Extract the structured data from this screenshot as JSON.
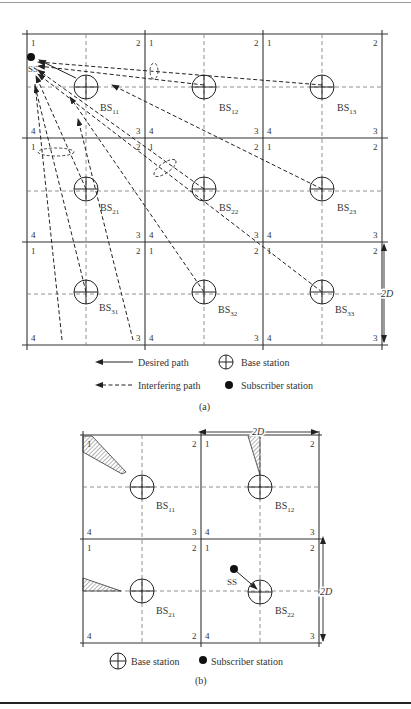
{
  "figure_a": {
    "caption": "(a)",
    "corner_labels": [
      "1",
      "2",
      "3",
      "4"
    ],
    "base_stations": [
      {
        "id": "BS11",
        "label": "BS",
        "sub": "11"
      },
      {
        "id": "BS12",
        "label": "BS",
        "sub": "12"
      },
      {
        "id": "BS13",
        "label": "BS",
        "sub": "13"
      },
      {
        "id": "BS21",
        "label": "BS",
        "sub": "21"
      },
      {
        "id": "BS22",
        "label": "BS",
        "sub": "22"
      },
      {
        "id": "BS23",
        "label": "BS",
        "sub": "23"
      },
      {
        "id": "BS31",
        "label": "BS",
        "sub": "31"
      },
      {
        "id": "BS32",
        "label": "BS",
        "sub": "32"
      },
      {
        "id": "BS33",
        "label": "BS",
        "sub": "33"
      }
    ],
    "subscriber_label": "SS",
    "dimension_label": "2D",
    "legend": {
      "desired_path": "Desired path",
      "interfering_path": "Interfering path",
      "base_station": "Base station",
      "subscriber_station": "Subscriber station"
    }
  },
  "figure_b": {
    "caption": "(b)",
    "base_stations": [
      {
        "id": "BS11",
        "label": "BS",
        "sub": "11"
      },
      {
        "id": "BS12",
        "label": "BS",
        "sub": "12"
      },
      {
        "id": "BS21",
        "label": "BS",
        "sub": "21"
      },
      {
        "id": "BS22",
        "label": "BS",
        "sub": "22"
      }
    ],
    "subscriber_label": "SS",
    "dimension_label_top": "2D",
    "dimension_label_right": "2D",
    "legend": {
      "base_station": "Base station",
      "subscriber_station": "Subscriber station"
    }
  }
}
